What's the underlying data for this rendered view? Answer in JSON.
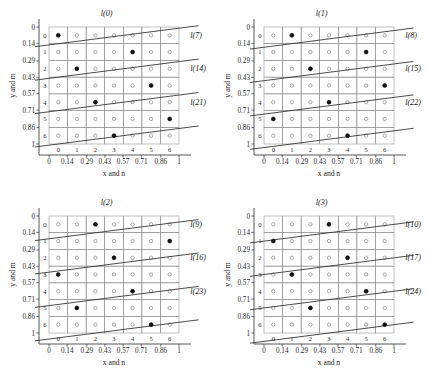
{
  "figure": {
    "grid_cols": 7,
    "grid_rows": 7,
    "axis": {
      "x_title": "x and n",
      "y_title": "y and m",
      "outer_ticks": [
        "0",
        "0.14",
        "0.29",
        "0.43",
        "0.57",
        "0.71",
        "0.86",
        "1"
      ],
      "inner_ticks": [
        "0",
        "1",
        "2",
        "3",
        "4",
        "5",
        "6"
      ]
    },
    "colors": {
      "line": "#2b2b2b",
      "grid": "#8c8c8c",
      "axis": "#2b2b2b",
      "dot_fill": "#111111",
      "cell_circle": "#6e6e6e",
      "background": "#ffffff"
    }
  },
  "chart_data": {
    "type": "scatter",
    "title": "",
    "xlabel": "x and n",
    "ylabel": "y and m",
    "xlim": [
      0,
      1
    ],
    "ylim": [
      0,
      1
    ],
    "grid": true,
    "x_ticks_value": [
      0,
      0.14,
      0.29,
      0.43,
      0.57,
      0.71,
      0.86,
      1
    ],
    "x_ticks_index": [
      0,
      1,
      2,
      3,
      4,
      5,
      6
    ],
    "y_ticks_value": [
      0,
      0.14,
      0.29,
      0.43,
      0.57,
      0.71,
      0.86,
      1
    ],
    "y_ticks_index": [
      0,
      1,
      2,
      3,
      4,
      5,
      6
    ],
    "panels": [
      {
        "id": "panel-top-left",
        "position": "top-left",
        "line_labels": [
          "l(0)",
          "l(7)",
          "l(14)",
          "l(21)"
        ],
        "lines": [
          {
            "name": "l(0)",
            "intercept_row": 0.5,
            "slope_rows_per_col": -0.1429,
            "label_anchor": {
              "col": 2.6,
              "row": -1.15
            }
          },
          {
            "name": "l(7)",
            "intercept_row": 2.5,
            "slope_rows_per_col": -0.1429,
            "label_anchor": {
              "col": 7.1,
              "row": 0.15
            }
          },
          {
            "name": "l(14)",
            "intercept_row": 4.5,
            "slope_rows_per_col": -0.1429,
            "label_anchor": {
              "col": 7.1,
              "row": 2.15
            }
          },
          {
            "name": "l(21)",
            "intercept_row": 6.5,
            "slope_rows_per_col": -0.1429,
            "label_anchor": {
              "col": 7.1,
              "row": 4.15
            }
          }
        ],
        "dots": [
          {
            "col": 0,
            "row": 0
          },
          {
            "col": 4,
            "row": 1
          },
          {
            "col": 1,
            "row": 2
          },
          {
            "col": 5,
            "row": 3
          },
          {
            "col": 2,
            "row": 4
          },
          {
            "col": 6,
            "row": 5
          },
          {
            "col": 3,
            "row": 6
          }
        ]
      },
      {
        "id": "panel-top-right",
        "position": "top-right",
        "line_labels": [
          "l(1)",
          "l(8)",
          "l(15)",
          "l(22)"
        ],
        "lines": [
          {
            "name": "l(1)",
            "intercept_row": 0.64,
            "slope_rows_per_col": -0.1429,
            "label_anchor": {
              "col": 2.6,
              "row": -1.15
            }
          },
          {
            "name": "l(8)",
            "intercept_row": 2.64,
            "slope_rows_per_col": -0.1429,
            "label_anchor": {
              "col": 7.1,
              "row": 0.15
            }
          },
          {
            "name": "l(15)",
            "intercept_row": 4.64,
            "slope_rows_per_col": -0.1429,
            "label_anchor": {
              "col": 7.1,
              "row": 2.15
            }
          },
          {
            "name": "l(22)",
            "intercept_row": 6.64,
            "slope_rows_per_col": -0.1429,
            "label_anchor": {
              "col": 7.1,
              "row": 4.15
            }
          }
        ],
        "dots": [
          {
            "col": 1,
            "row": 0
          },
          {
            "col": 5,
            "row": 1
          },
          {
            "col": 2,
            "row": 2
          },
          {
            "col": 6,
            "row": 3
          },
          {
            "col": 3,
            "row": 4
          },
          {
            "col": 0,
            "row": 5
          },
          {
            "col": 4,
            "row": 6
          }
        ]
      },
      {
        "id": "panel-bottom-left",
        "position": "bottom-left",
        "line_labels": [
          "l(2)",
          "l(9)",
          "l(16)",
          "l(23)"
        ],
        "lines": [
          {
            "name": "l(2)",
            "intercept_row": 0.79,
            "slope_rows_per_col": -0.1429,
            "label_anchor": {
              "col": 2.6,
              "row": -1.15
            }
          },
          {
            "name": "l(9)",
            "intercept_row": 2.79,
            "slope_rows_per_col": -0.1429,
            "label_anchor": {
              "col": 7.1,
              "row": 0.15
            }
          },
          {
            "name": "l(16)",
            "intercept_row": 4.79,
            "slope_rows_per_col": -0.1429,
            "label_anchor": {
              "col": 7.1,
              "row": 2.15
            }
          },
          {
            "name": "l(23)",
            "intercept_row": 6.79,
            "slope_rows_per_col": -0.1429,
            "label_anchor": {
              "col": 7.1,
              "row": 4.15
            }
          }
        ],
        "dots": [
          {
            "col": 2,
            "row": 0
          },
          {
            "col": 6,
            "row": 1
          },
          {
            "col": 3,
            "row": 2
          },
          {
            "col": 0,
            "row": 3
          },
          {
            "col": 4,
            "row": 4
          },
          {
            "col": 1,
            "row": 5
          },
          {
            "col": 5,
            "row": 6
          }
        ]
      },
      {
        "id": "panel-bottom-right",
        "position": "bottom-right",
        "line_labels": [
          "l(3)",
          "l(10)",
          "l(17)",
          "l(24)"
        ],
        "lines": [
          {
            "name": "l(3)",
            "intercept_row": 0.93,
            "slope_rows_per_col": -0.1429,
            "label_anchor": {
              "col": 2.6,
              "row": -1.15
            }
          },
          {
            "name": "l(10)",
            "intercept_row": 2.93,
            "slope_rows_per_col": -0.1429,
            "label_anchor": {
              "col": 7.1,
              "row": 0.15
            }
          },
          {
            "name": "l(17)",
            "intercept_row": 4.93,
            "slope_rows_per_col": -0.1429,
            "label_anchor": {
              "col": 7.1,
              "row": 2.15
            }
          },
          {
            "name": "l(24)",
            "intercept_row": 6.93,
            "slope_rows_per_col": -0.1429,
            "label_anchor": {
              "col": 7.1,
              "row": 4.15
            }
          }
        ],
        "dots": [
          {
            "col": 3,
            "row": 0
          },
          {
            "col": 0,
            "row": 1
          },
          {
            "col": 4,
            "row": 2
          },
          {
            "col": 1,
            "row": 3
          },
          {
            "col": 5,
            "row": 4
          },
          {
            "col": 2,
            "row": 5
          },
          {
            "col": 6,
            "row": 6
          }
        ]
      }
    ]
  }
}
